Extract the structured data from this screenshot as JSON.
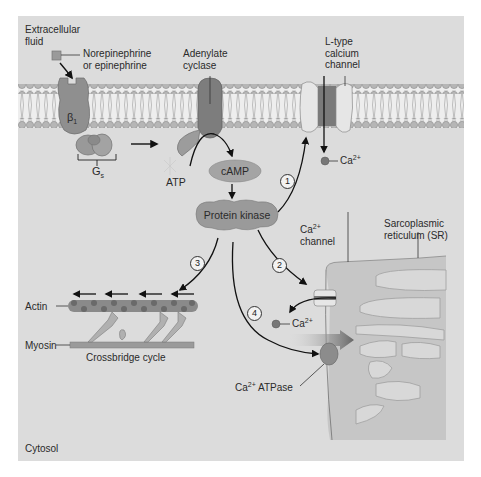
{
  "diagram": {
    "type": "signaling-pathway",
    "regions": {
      "extracellular": "Extracellular fluid",
      "intracellular": "Cytosol"
    },
    "labels": {
      "ligand_line1": "Norepinephrine",
      "ligand_line2": "or epinephrine",
      "receptor": "β",
      "receptor_sub": "1",
      "g_protein": "G",
      "g_protein_sub": "s",
      "adenylate_line1": "Adenylate",
      "adenylate_line2": "cyclase",
      "atp": "ATP",
      "camp": "cAMP",
      "protein_kinase": "Protein kinase",
      "ltype_line1": "L-type",
      "ltype_line2": "calcium",
      "ltype_line3": "channel",
      "ca_ion": "Ca",
      "ca_charge": "2+",
      "ca_channel_line1": "Ca",
      "ca_channel_sup": "2+",
      "ca_channel_line2": "channel",
      "sr_line1": "Sarcoplasmic",
      "sr_line2": "reticulum (SR)",
      "actin": "Actin",
      "myosin": "Myosin",
      "crossbridge": "Crossbridge cycle",
      "ca_atpase_prefix": "Ca",
      "ca_atpase_sup": "2+",
      "ca_atpase_suffix": " ATPase",
      "extracellular_line1": "Extracellular",
      "extracellular_line2": "fluid",
      "cytosol": "Cytosol"
    },
    "steps": [
      {
        "number": "1",
        "target": "L-type calcium channel"
      },
      {
        "number": "2",
        "target": "SR Ca2+ channel"
      },
      {
        "number": "3",
        "target": "Actin / crossbridge cycle"
      },
      {
        "number": "4",
        "target": "Ca2+ ATPase"
      }
    ],
    "colors": {
      "background": "#dcdcdc",
      "membrane_head": "#b8b8b8",
      "protein": "#8f8f8f",
      "protein_dark": "#6e6e6e",
      "pill": "#a0a0a0",
      "sr_fill": "#c6c6c6"
    }
  }
}
